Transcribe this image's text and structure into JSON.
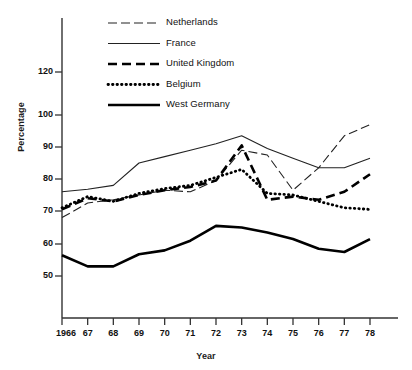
{
  "chart_data": {
    "type": "line",
    "title": "",
    "xlabel": "Year",
    "ylabel": "Percentage",
    "grid": false,
    "legend_position": "top-left-inside",
    "x": [
      1966,
      1967,
      1968,
      1969,
      1970,
      1971,
      1972,
      1973,
      1974,
      1975,
      1976,
      1977,
      1978
    ],
    "xtick_labels": [
      "1966",
      "67",
      "68",
      "69",
      "70",
      "71",
      "72",
      "73",
      "74",
      "75",
      "76",
      "77",
      "78"
    ],
    "ytick_labels": [
      "50",
      "60",
      "70",
      "80",
      "90",
      "100",
      "120"
    ],
    "ytick_values": [
      50,
      60,
      70,
      80,
      90,
      100,
      120
    ],
    "ylim": [
      43,
      128
    ],
    "y_axis_nonuniform": true,
    "series": [
      {
        "name": "Netherlands",
        "style": "thin-long-dash",
        "color": "#222222",
        "values": [
          68.0,
          72.5,
          73.5,
          75.0,
          76.5,
          76.0,
          79.5,
          89.0,
          87.5,
          76.5,
          83.5,
          93.5,
          97.0
        ]
      },
      {
        "name": "France",
        "style": "thin-solid",
        "color": "#222222",
        "values": [
          76.0,
          76.8,
          78.0,
          85.0,
          87.0,
          89.0,
          91.0,
          93.5,
          89.5,
          86.5,
          83.5,
          83.5,
          86.5
        ]
      },
      {
        "name": "United Kingdom",
        "style": "thick-dash",
        "color": "#000000",
        "values": [
          70.5,
          74.0,
          73.0,
          75.0,
          76.5,
          77.5,
          79.5,
          90.5,
          73.5,
          74.5,
          73.5,
          76.0,
          81.5
        ]
      },
      {
        "name": "Belgium",
        "style": "thick-dot",
        "color": "#000000",
        "values": [
          71.0,
          74.5,
          73.0,
          75.5,
          77.0,
          78.0,
          80.5,
          83.0,
          75.5,
          75.0,
          73.0,
          71.0,
          70.5
        ]
      },
      {
        "name": "West Germany",
        "style": "thick-solid",
        "color": "#000000",
        "values": [
          56.5,
          53.0,
          53.0,
          56.8,
          58.0,
          61.0,
          65.5,
          65.0,
          63.5,
          61.5,
          58.5,
          57.5,
          61.5
        ]
      }
    ]
  },
  "legend": {
    "items": [
      {
        "label": "Netherlands"
      },
      {
        "label": "France"
      },
      {
        "label": "United Kingdom"
      },
      {
        "label": "Belgium"
      },
      {
        "label": "West Germany"
      }
    ]
  },
  "axes": {
    "x_title": "Year",
    "y_title": "Percentage"
  }
}
